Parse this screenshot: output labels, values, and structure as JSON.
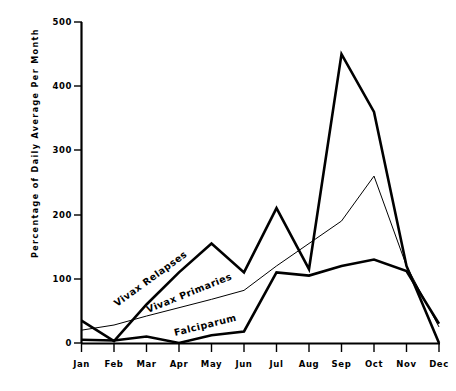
{
  "chart_data": {
    "type": "line",
    "title": "",
    "xlabel": "",
    "ylabel": "Percentage of Daily Average Per Month",
    "categories": [
      "Jan",
      "Feb",
      "Mar",
      "Apr",
      "May",
      "Jun",
      "Jul",
      "Aug",
      "Sep",
      "Oct",
      "Nov",
      "Dec"
    ],
    "ylim": [
      0,
      500
    ],
    "yticks": [
      0,
      100,
      200,
      300,
      400,
      500
    ],
    "ytick_labels": [
      "0",
      "100",
      "200",
      "300",
      "400",
      "500"
    ],
    "grid": false,
    "legend_position": "inline-annotations",
    "series": [
      {
        "name": "Vivax Relapses",
        "style": "thick-black-line",
        "values": [
          35,
          3,
          60,
          110,
          155,
          110,
          210,
          115,
          450,
          360,
          120,
          0
        ]
      },
      {
        "name": "Vivax Primaries",
        "style": "thin-black-line",
        "values": [
          20,
          28,
          42,
          55,
          68,
          82,
          120,
          155,
          190,
          260,
          120,
          25
        ]
      },
      {
        "name": "Falciparum",
        "style": "thick-black-line",
        "values": [
          5,
          4,
          10,
          0,
          12,
          18,
          110,
          105,
          120,
          130,
          112,
          30
        ]
      }
    ],
    "annotations": [
      {
        "text": "Vivax Relapses",
        "angle": -36
      },
      {
        "text": "Vivax Primaries",
        "angle": -22
      },
      {
        "text": "Falciparum",
        "angle": -14
      }
    ]
  },
  "caption": {
    "clipped_text": ""
  }
}
